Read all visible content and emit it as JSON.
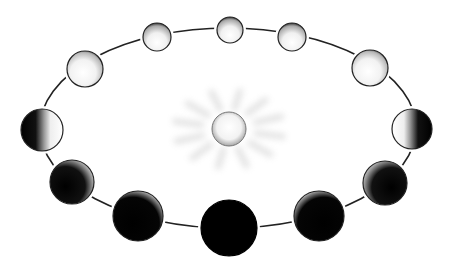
{
  "diagram": {
    "type": "orbital-phases",
    "colors": {
      "background": "#ffffff",
      "orbit_line": "#222222",
      "dark": "#000000",
      "lit": "#ffffff",
      "outline": "#222222",
      "glow": "#bdbdbd"
    },
    "center_body": {
      "name": "sun",
      "cx": 229,
      "cy": 129,
      "r": 17
    },
    "orbit": {
      "cx": 228,
      "cy": 128,
      "rx": 188,
      "ry": 100
    },
    "bodies": [
      {
        "id": "top-center",
        "phase": "full",
        "cx": 230,
        "cy": 30,
        "r": 13,
        "lit_side": "full"
      },
      {
        "id": "top-right",
        "phase": "gibbous",
        "cx": 292,
        "cy": 37,
        "r": 14,
        "lit_side": "full"
      },
      {
        "id": "upper-right",
        "phase": "gibbous",
        "cx": 370,
        "cy": 68,
        "r": 18,
        "lit_side": "full"
      },
      {
        "id": "right",
        "phase": "quarter",
        "cx": 412,
        "cy": 129,
        "r": 20,
        "lit_side": "left"
      },
      {
        "id": "lower-right",
        "phase": "crescent",
        "cx": 385,
        "cy": 183,
        "r": 22,
        "lit_side": "left-thin"
      },
      {
        "id": "bottom-right",
        "phase": "thin-crescent",
        "cx": 319,
        "cy": 216,
        "r": 25,
        "lit_side": "left-edge"
      },
      {
        "id": "bottom-center",
        "phase": "new",
        "cx": 229,
        "cy": 228,
        "r": 28,
        "lit_side": "none"
      },
      {
        "id": "bottom-left",
        "phase": "thin-crescent",
        "cx": 138,
        "cy": 216,
        "r": 25,
        "lit_side": "right-edge"
      },
      {
        "id": "lower-left",
        "phase": "crescent",
        "cx": 72,
        "cy": 182,
        "r": 22,
        "lit_side": "right-thin"
      },
      {
        "id": "left",
        "phase": "quarter",
        "cx": 42,
        "cy": 130,
        "r": 21,
        "lit_side": "right"
      },
      {
        "id": "upper-left",
        "phase": "gibbous",
        "cx": 85,
        "cy": 69,
        "r": 18,
        "lit_side": "full"
      },
      {
        "id": "top-left",
        "phase": "gibbous",
        "cx": 157,
        "cy": 37,
        "r": 14,
        "lit_side": "full"
      }
    ]
  }
}
